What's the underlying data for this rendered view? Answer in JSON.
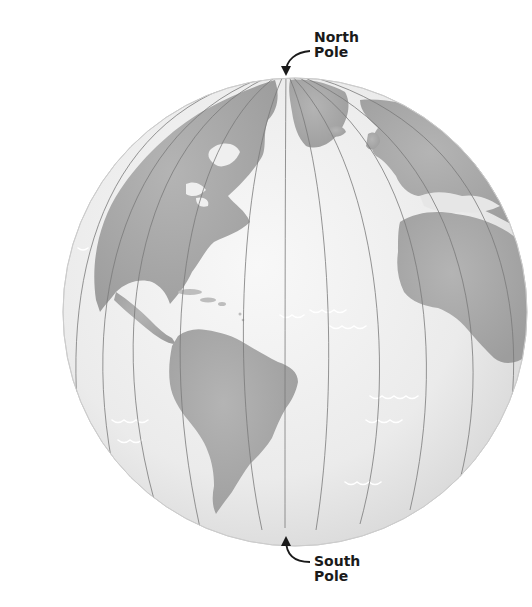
{
  "labels": {
    "north": {
      "line1": "North",
      "line2": "Pole"
    },
    "south": {
      "line1": "South",
      "line2": "Pole"
    }
  },
  "colors": {
    "background": "#ffffff",
    "ocean": "#ececec",
    "ocean_highlight": "#f7f7f7",
    "land": "#a9a9a9",
    "meridian": "#777777",
    "wave": "#ffffff",
    "text": "#1a1a1a"
  },
  "globe": {
    "cx": 295,
    "cy": 312,
    "rx": 232,
    "ry": 234,
    "north_pole": [
      286,
      70
    ],
    "south_pole": [
      285,
      528
    ]
  },
  "features": [
    "north-america",
    "south-america",
    "greenland",
    "africa",
    "europe",
    "caribbean-islands",
    "ocean-waves",
    "meridians"
  ]
}
